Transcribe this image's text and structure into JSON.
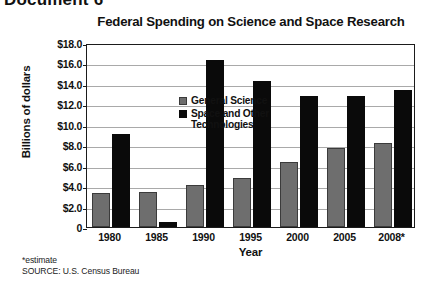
{
  "document": {
    "heading": "Document 6"
  },
  "footnotes": {
    "estimate_note": "*estimate",
    "source": "SOURCE: U.S. Census Bureau"
  },
  "legend": {
    "position": "top-left-inside",
    "entries": [
      {
        "label": "General Science",
        "color": "#6e6e6e",
        "swatch": "general"
      },
      {
        "label": "Space and Other Technologies",
        "color": "#0a0a0a",
        "swatch": "space"
      }
    ]
  },
  "axes": {
    "y_ticks": [
      "$18.0",
      "$16.0",
      "$14.0",
      "$12.0",
      "$10.0",
      "$8.0",
      "$6.0",
      "$4.0",
      "$2.0",
      "0"
    ],
    "y_tick_values": [
      18,
      16,
      14,
      12,
      10,
      8,
      6,
      4,
      2,
      0
    ]
  },
  "chart_data": {
    "type": "bar",
    "title": "Federal Spending on Science and Space Research",
    "xlabel": "Year",
    "ylabel": "Billions of dollars",
    "categories": [
      "1980",
      "1985",
      "1990",
      "1995",
      "2000",
      "2005",
      "2008*"
    ],
    "series": [
      {
        "name": "General Science",
        "color": "#6e6e6e",
        "values": [
          3.3,
          3.4,
          4.1,
          4.8,
          6.4,
          7.7,
          8.2
        ]
      },
      {
        "name": "Space and Other Technologies",
        "color": "#0a0a0a",
        "values": [
          9.1,
          0.5,
          16.3,
          14.3,
          12.8,
          12.8,
          13.4
        ]
      }
    ],
    "ylim": [
      0,
      18
    ],
    "ytick_step": 2,
    "grid": true,
    "legend_position": "inside top-left",
    "units": "Billions of dollars"
  }
}
